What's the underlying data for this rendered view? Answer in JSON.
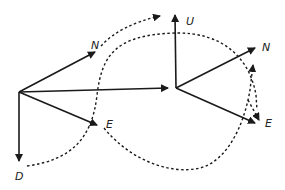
{
  "diagram": {
    "colors": {
      "stroke": "#1a1a1a",
      "background": "#ffffff"
    },
    "left_frame": {
      "labels": {
        "north": "N",
        "east": "E",
        "down": "D"
      }
    },
    "right_frame": {
      "labels": {
        "up": "U",
        "north": "N",
        "east": "E"
      }
    }
  }
}
